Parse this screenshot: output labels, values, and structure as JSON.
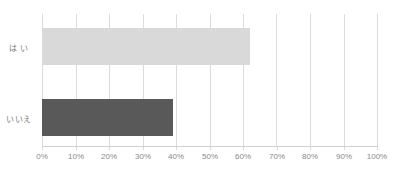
{
  "chart_data": {
    "type": "bar",
    "orientation": "horizontal",
    "title": "",
    "xlabel": "",
    "ylabel": "",
    "categories": [
      "は い",
      "いいえ"
    ],
    "values": [
      62,
      39
    ],
    "value_suffix": "%",
    "xlim": [
      0,
      100
    ],
    "xticks": [
      0,
      10,
      20,
      30,
      40,
      50,
      60,
      70,
      80,
      90,
      100
    ],
    "xtick_labels": [
      "0%",
      "10%",
      "20%",
      "30%",
      "40%",
      "50%",
      "60%",
      "70%",
      "80%",
      "90%",
      "100%"
    ],
    "grid": "vertical",
    "legend": "none",
    "data_labels": "none",
    "bar_colors": [
      "#d9d9d9",
      "#595959"
    ],
    "series": [
      {
        "name": "回答割合",
        "points": [
          {
            "category": "は い",
            "value": 62,
            "color": "#d9d9d9"
          },
          {
            "category": "いいえ",
            "value": 39,
            "color": "#595959"
          }
        ]
      }
    ]
  },
  "style": {
    "background": "#ffffff",
    "gridline_color": "#dcdcdc",
    "axis_color": "#d0d0d0",
    "tick_label_color": "#8a8a8a",
    "category_label_color": "#7a7a7a"
  }
}
